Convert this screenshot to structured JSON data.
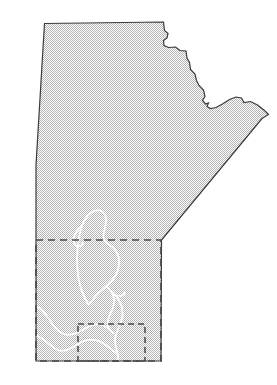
{
  "figure": {
    "width": 277,
    "height": 385,
    "background_color": "#ffffff"
  },
  "colors": {
    "land_fill": "#d2d2d2",
    "land_dither_dot": "#c0c0c0",
    "province_border": "#3a3a3a",
    "region_box_border": "#4a4a4a",
    "water_outline": "#ffffff",
    "page_background": "#ffffff"
  },
  "layers": [
    {
      "name": "province-outline",
      "label": "Manitoba provincial boundary",
      "style": "solid",
      "stroke": "#3a3a3a",
      "stroke_width": 1.2,
      "fill": "#d2d2d2"
    },
    {
      "name": "southern-region-box",
      "label": "Southern Manitoba study area",
      "style": "dashed",
      "stroke": "#4a4a4a",
      "stroke_width": 1.6,
      "dash_pattern": "7,5"
    },
    {
      "name": "inner-region-box",
      "label": "Inner sub-region",
      "style": "dashed",
      "stroke": "#4a4a4a",
      "stroke_width": 1.4,
      "dash_pattern": "6,4"
    },
    {
      "name": "water-bodies",
      "label": "Lakes and rivers",
      "style": "solid",
      "stroke": "#ffffff",
      "stroke_width": 1.6
    }
  ],
  "geometry": {
    "province_outline_path": "M 44.5,23.5 L 163.5,22.0 L 164.5,30.5 L 168.0,33.5 L 167.0,38.0 L 163.5,40.5 L 164.0,45.5 L 168.5,47.5 L 175.5,47.0 L 180.0,50.5 L 186.0,51.0 L 187.0,58.0 L 189.5,62.5 L 190.5,69.5 L 195.0,74.0 L 196.5,80.5 L 199.0,85.5 L 203.5,90.0 L 205.0,96.5 L 202.5,100.5 L 205.5,104.0 L 208.5,103.0 L 207.0,106.5 L 210.5,108.5 L 216.0,107.5 L 222.5,104.0 L 229.5,99.5 L 236.0,97.0 L 241.5,98.0 L 244.0,102.5 L 250.5,101.5 L 257.5,105.0 L 264.5,110.5 L 268.5,114.5 L 262.0,118.5 L 161.5,240.0 L 161.0,361.0 L 36.0,361.0 L 36.0,165.0 Z",
    "province_key_vertices": [
      {
        "name": "northwest-corner",
        "x": 44.5,
        "y": 23.5
      },
      {
        "name": "north-edge-east-end",
        "x": 163.5,
        "y": 22.0
      },
      {
        "name": "hudson-bay-coast-start",
        "x": 186.0,
        "y": 51.0
      },
      {
        "name": "hudson-bay-notch",
        "x": 205.0,
        "y": 96.5
      },
      {
        "name": "northeast-tip",
        "x": 268.5,
        "y": 114.5
      },
      {
        "name": "southeast-corner",
        "x": 161.5,
        "y": 240.0
      },
      {
        "name": "southeast-bottom-corner",
        "x": 161.0,
        "y": 361.0
      },
      {
        "name": "southwest-corner",
        "x": 36.0,
        "y": 361.0
      },
      {
        "name": "west-border-top",
        "x": 44.5,
        "y": 23.5
      }
    ],
    "southern_region_box": {
      "x": 36.0,
      "y": 240.0,
      "width": 125.0,
      "height": 121.0
    },
    "inner_region_box": {
      "x": 78.0,
      "y": 324.0,
      "width": 67.0,
      "height": 37.0
    },
    "water_paths": [
      {
        "name": "lake-winnipeg-north-basin",
        "d": "M 88.5,304.5 C 84.0,297.0 80.0,288.0 78.5,278.0 C 77.0,268.5 76.5,258.5 77.5,249.0 C 78.2,241.0 79.5,233.0 82.0,226.0 C 83.8,221.0 86.5,216.5 90.0,213.5 C 93.0,211.0 96.5,209.5 100.0,210.5 C 103.5,211.5 105.5,215.0 106.0,219.0 C 106.5,223.5 105.0,227.5 104.0,231.5 C 103.2,234.5 103.0,237.5 104.5,240.0 C 106.5,243.5 110.0,245.0 113.0,247.5 C 116.5,250.5 118.5,255.0 119.0,260.0 C 119.5,265.5 118.0,271.0 115.5,275.5 C 113.0,280.0 109.5,283.5 106.0,286.5 C 102.0,290.0 97.5,293.0 94.5,297.5 C 92.0,301.0 90.5,304.0 88.5,304.5 Z"
      },
      {
        "name": "lake-winnipeg-west-arm",
        "d": "M 82.0,226.0 C 79.0,228.5 76.0,231.5 74.5,235.5 C 73.0,239.5 73.5,243.5 76.0,245.5 C 78.5,247.5 81.5,246.0 83.0,243.0"
      },
      {
        "name": "lake-winnipeg-narrows",
        "d": "M 106.0,286.5 C 108.5,288.0 111.0,290.5 112.5,293.5 C 114.0,296.5 114.5,300.0 114.0,303.5 C 113.5,307.5 111.5,311.0 110.0,314.5 C 108.5,318.0 107.5,321.5 108.0,325.0 C 108.5,328.5 110.5,331.0 113.0,333.0"
      },
      {
        "name": "lake-winnipeg-south-basin",
        "d": "M 110.0,290.0 C 113.5,293.0 117.0,296.5 119.5,301.0 C 122.0,305.5 123.0,310.5 122.5,315.5 C 122.0,320.5 120.0,325.0 118.0,329.5 C 116.5,333.0 115.0,336.5 115.0,340.0 C 115.0,344.5 116.5,349.0 117.5,353.5 C 118.2,356.5 118.5,359.0 118.2,361.0"
      },
      {
        "name": "red-river",
        "d": "M 117.5,353.5 C 118.0,356.0 118.2,358.5 118.2,361.0"
      },
      {
        "name": "lake-manitoba",
        "d": "M 36.5,306.0 C 40.0,308.0 43.5,311.5 46.5,315.5 C 49.5,319.5 52.0,324.0 55.0,327.5 C 58.0,331.0 61.5,333.5 65.5,334.5 C 70.0,335.5 74.5,334.0 78.5,332.0 C 83.0,329.8 87.0,327.0 91.5,325.5 C 96.0,324.0 100.5,324.0 104.5,326.0 C 108.0,327.8 110.5,330.5 113.0,333.0"
      },
      {
        "name": "assiniboine-river",
        "d": "M 36.5,335.5 C 41.0,337.5 45.0,340.5 48.5,343.5 C 52.0,346.5 55.0,349.5 59.0,350.5 C 63.5,351.6 68.0,350.0 72.0,347.8 C 76.5,345.2 80.5,342.0 85.5,340.5 C 90.5,339.0 95.5,339.5 100.0,341.5 C 104.5,343.5 108.0,346.5 111.5,349.5 C 114.0,351.6 116.0,352.8 117.5,353.5"
      },
      {
        "name": "lake-winnipegosis-tail",
        "d": "M 112.5,293.5 C 114.5,295.0 117.0,296.0 119.5,296.0 C 122.0,296.0 124.0,294.5 125.0,292.5"
      }
    ]
  },
  "labels": []
}
